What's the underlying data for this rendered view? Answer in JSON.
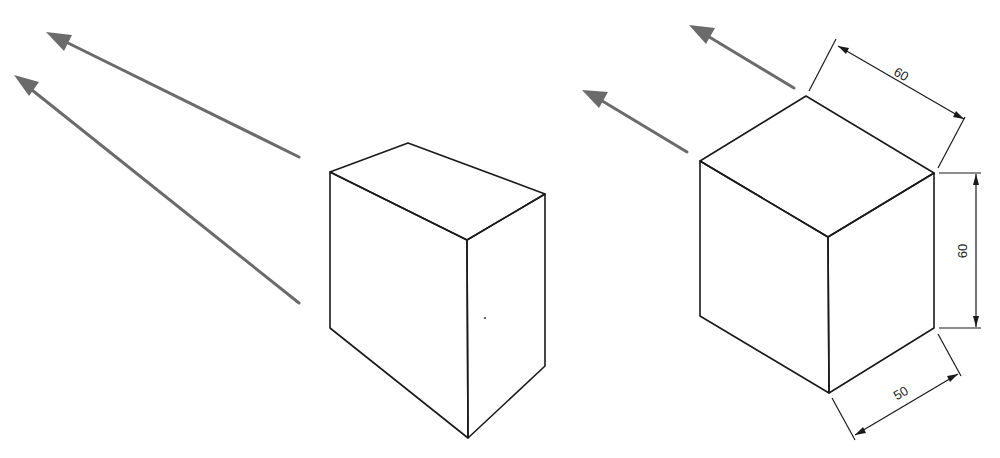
{
  "figure": {
    "left_panel": {
      "description": "Perspective view of a rectangular block with two converging light/viewing rays",
      "arrows": 2
    },
    "right_panel": {
      "description": "Isometric view of a block with dimensions and two parallel rays",
      "arrows": 2,
      "dimensions": {
        "top_edge": "60",
        "height": "60",
        "bottom_edge": "50"
      }
    },
    "colors": {
      "edge": "#1a1a1a",
      "arrow": "#6b6b6b",
      "background": "#ffffff"
    }
  }
}
